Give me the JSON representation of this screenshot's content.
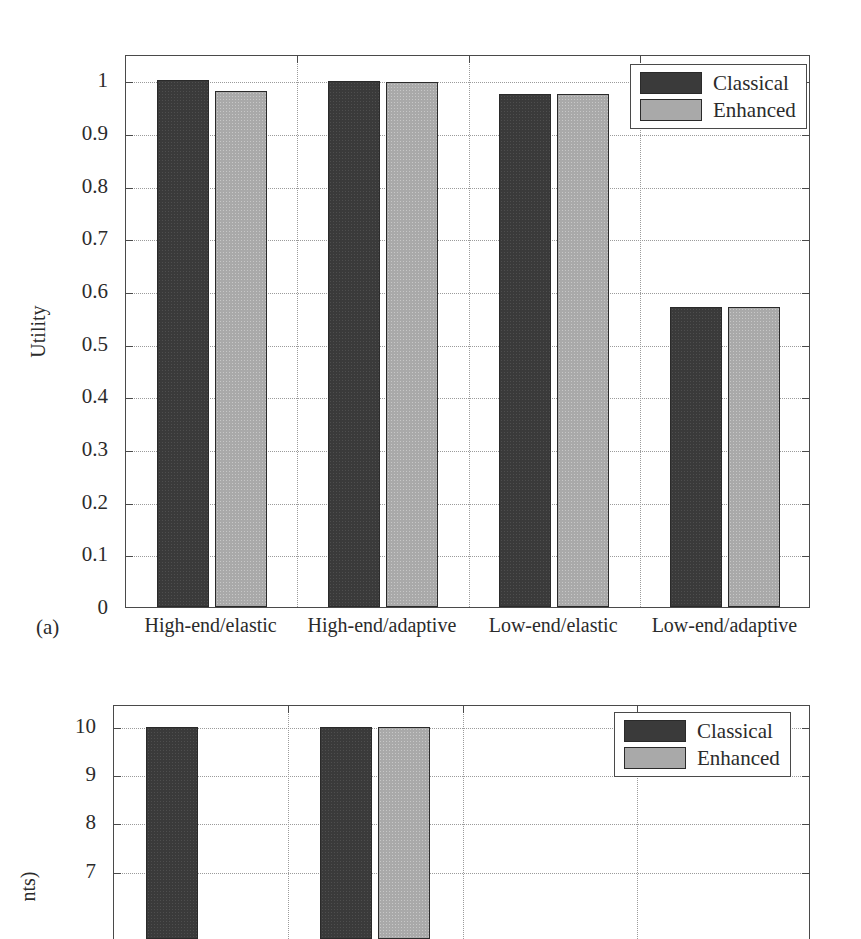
{
  "chart_data": [
    {
      "id": "a",
      "type": "bar",
      "subfigure_label": "(a)",
      "title": "",
      "xlabel": "",
      "ylabel": "Utility",
      "ylim": [
        0,
        1.05
      ],
      "ytick_values": [
        0,
        0.1,
        0.2,
        0.3,
        0.4,
        0.5,
        0.6,
        0.7,
        0.8,
        0.9,
        1
      ],
      "ytick_labels": [
        "0",
        "0.1",
        "0.2",
        "0.3",
        "0.4",
        "0.5",
        "0.6",
        "0.7",
        "0.8",
        "0.9",
        "1"
      ],
      "grid": true,
      "legend_position": "top-right",
      "categories": [
        "High-end/elastic",
        "High-end/adaptive",
        "Low-end/elastic",
        "Low-end/adaptive"
      ],
      "series": [
        {
          "name": "Classical",
          "color": "#3a3a3a",
          "values": [
            1.0,
            0.998,
            0.975,
            0.57
          ]
        },
        {
          "name": "Enhanced",
          "color": "#a9a9a9",
          "values": [
            0.98,
            0.997,
            0.974,
            0.569
          ]
        }
      ]
    },
    {
      "id": "b",
      "type": "bar",
      "subfigure_label": "",
      "title": "",
      "xlabel": "",
      "ylabel": "nts)",
      "ylim": [
        5.6,
        10.45
      ],
      "ytick_values": [
        7,
        8,
        9,
        10
      ],
      "ytick_labels": [
        "7",
        "8",
        "9",
        "10"
      ],
      "grid": true,
      "legend_position": "top-right",
      "categories": [
        "",
        "",
        "",
        ""
      ],
      "series": [
        {
          "name": "Classical",
          "color": "#3a3a3a",
          "values": [
            10,
            10,
            null,
            null
          ]
        },
        {
          "name": "Enhanced",
          "color": "#a9a9a9",
          "values": [
            null,
            9.99,
            null,
            null
          ]
        }
      ],
      "note": "lower subfigure is cropped by the page edge"
    }
  ],
  "figure_a": {
    "subfigure_label": "(a)",
    "ylabel": "Utility",
    "ytick_labels": [
      "1",
      "0.9",
      "0.8",
      "0.7",
      "0.6",
      "0.5",
      "0.4",
      "0.3",
      "0.2",
      "0.1",
      "0"
    ],
    "xtick_labels": [
      "High-end/elastic",
      "High-end/adaptive",
      "Low-end/elastic",
      "Low-end/adaptive"
    ],
    "legend": {
      "items": [
        {
          "label": "Classical",
          "color": "#3a3a3a"
        },
        {
          "label": "Enhanced",
          "color": "#a9a9a9"
        }
      ]
    }
  },
  "figure_b": {
    "ylabel": "nts)",
    "ytick_labels": [
      "10",
      "9",
      "8",
      "7"
    ],
    "legend": {
      "items": [
        {
          "label": "Classical",
          "color": "#3a3a3a"
        },
        {
          "label": "Enhanced",
          "color": "#a9a9a9"
        }
      ]
    }
  }
}
